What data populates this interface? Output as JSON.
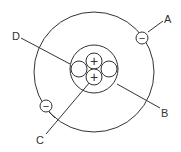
{
  "diagram": {
    "type": "atom-model",
    "labels": {
      "A": "A",
      "B": "B",
      "C": "C",
      "D": "D"
    },
    "symbols": {
      "electron": "−",
      "proton": "+"
    },
    "stroke_color": "#333333"
  }
}
